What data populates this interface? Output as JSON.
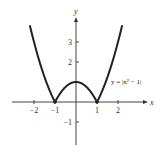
{
  "chart_data": {
    "type": "line",
    "title": "",
    "xlabel": "x",
    "ylabel": "y",
    "xlim": [
      -2.2,
      2.2
    ],
    "ylim": [
      -1.8,
      3.9
    ],
    "grid": false,
    "x_ticks": [
      {
        "value": -2,
        "label": "−2"
      },
      {
        "value": -1,
        "label": "−1"
      },
      {
        "value": 1,
        "label": "1"
      },
      {
        "value": 2,
        "label": "2"
      }
    ],
    "y_ticks": [
      {
        "value": 3,
        "label": "3"
      },
      {
        "value": 2,
        "label": "2"
      },
      {
        "value": -1,
        "label": "−1"
      }
    ],
    "series": [
      {
        "name": "y = |x^2 - 1|",
        "function": "abs(x^2 - 1)",
        "x_range": [
          -2.2,
          2.2
        ]
      }
    ],
    "annotations": [
      {
        "text": "y = |x² − 1|",
        "near": "right branch, x≈1.4, y≈1"
      }
    ]
  }
}
